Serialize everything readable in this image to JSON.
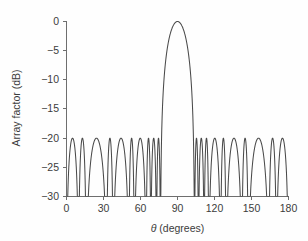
{
  "chart_data": {
    "type": "line",
    "title": "",
    "xlabel": "θ (degrees)",
    "ylabel": "Array factor (dB)",
    "xlim": [
      0,
      180
    ],
    "ylim": [
      -30,
      0
    ],
    "xticks": [
      0,
      30,
      60,
      90,
      120,
      150,
      180
    ],
    "xtick_labels": [
      "0",
      "30",
      "60",
      "90",
      "120",
      "150",
      "180"
    ],
    "yticks": [
      0,
      -5,
      -10,
      -15,
      -20,
      -25,
      -30
    ],
    "ytick_labels": [
      "0",
      "−5",
      "−10",
      "−15",
      "−20",
      "−25",
      "−30"
    ],
    "grid": false,
    "legend": null,
    "series": [
      {
        "name": "Array factor",
        "color": "#4a4a4a",
        "peak_value_db": 0,
        "peak_angle_deg": 90,
        "sidelobe_level_db": -20,
        "nulls_deg": [
          9.8,
          16.0,
          32.6,
          37.8,
          50.6,
          55.0,
          64.6,
          68.4,
          73.0,
          76.2,
          103.8,
          107.0,
          111.6,
          115.4,
          125.0,
          129.4,
          142.2,
          147.4,
          164.0,
          170.2
        ],
        "sidelobe_peaks": [
          {
            "angle_deg": 13.0,
            "value_db": -20.4
          },
          {
            "angle_deg": 24.4,
            "value_db": -20.2
          },
          {
            "angle_deg": 35.2,
            "value_db": -20.3
          },
          {
            "angle_deg": 44.6,
            "value_db": -20.2
          },
          {
            "angle_deg": 53.0,
            "value_db": -20.3
          },
          {
            "angle_deg": 58.5,
            "value_db": -20.2
          },
          {
            "angle_deg": 66.5,
            "value_db": -20.3
          },
          {
            "angle_deg": 71.0,
            "value_db": -20.2
          },
          {
            "angle_deg": 74.6,
            "value_db": -20.4
          },
          {
            "angle_deg": 105.4,
            "value_db": -20.4
          },
          {
            "angle_deg": 109.0,
            "value_db": -20.2
          },
          {
            "angle_deg": 113.5,
            "value_db": -20.3
          },
          {
            "angle_deg": 121.5,
            "value_db": -20.2
          },
          {
            "angle_deg": 127.0,
            "value_db": -20.3
          },
          {
            "angle_deg": 135.4,
            "value_db": -20.2
          },
          {
            "angle_deg": 144.8,
            "value_db": -20.3
          },
          {
            "angle_deg": 155.6,
            "value_db": -20.2
          },
          {
            "angle_deg": 167.0,
            "value_db": -20.4
          }
        ],
        "endpoints": [
          {
            "angle_deg": 0,
            "value_db": -21.2
          },
          {
            "angle_deg": 180,
            "value_db": -21.2
          }
        ],
        "mainlobe_edges_deg": [
          76.2,
          103.8
        ],
        "x": [
          0,
          2,
          4,
          6,
          8,
          9.8,
          11,
          13,
          15,
          16,
          18,
          20,
          22,
          24.4,
          26,
          28,
          30,
          32.6,
          34,
          35.2,
          36,
          37.8,
          40,
          42,
          44.6,
          47,
          49,
          50.6,
          52,
          53,
          54,
          55,
          57,
          58.5,
          60,
          62,
          64.6,
          66.5,
          68.4,
          70,
          71,
          72,
          73,
          74.6,
          76.2,
          78,
          80,
          82,
          84,
          86,
          88,
          90,
          92,
          94,
          96,
          98,
          100,
          102,
          103.8,
          105.4,
          107,
          109,
          111.6,
          113.5,
          115.4,
          118,
          121.5,
          125,
          127,
          129.4,
          132,
          135.4,
          139,
          142.2,
          144.8,
          147.4,
          151,
          155.6,
          160,
          164,
          167,
          170.2,
          174,
          177,
          180
        ],
        "y": [
          -21.2,
          -22.0,
          -23.6,
          -26.2,
          -29.5,
          -41,
          -29.0,
          -20.4,
          -25.0,
          -33,
          -25.5,
          -22.0,
          -20.6,
          -20.2,
          -20.7,
          -22.4,
          -25.6,
          -40,
          -24.0,
          -20.3,
          -21.0,
          -39,
          -24.8,
          -21.4,
          -20.2,
          -21.6,
          -25.8,
          -41,
          -23.0,
          -20.3,
          -23.2,
          -38,
          -22.0,
          -20.2,
          -21.8,
          -26.5,
          -40,
          -20.3,
          -39,
          -22.0,
          -20.2,
          -23.0,
          -37,
          -20.4,
          -38,
          -22.0,
          -14.5,
          -9.2,
          -5.0,
          -2.2,
          -0.55,
          0.0,
          -0.55,
          -2.2,
          -5.0,
          -9.2,
          -14.5,
          -22.0,
          -38,
          -20.4,
          -37,
          -20.2,
          -39,
          -20.3,
          -40,
          -24.0,
          -20.2,
          -20.6,
          -20.3,
          -38,
          -23.5,
          -20.2,
          -23.8,
          -41,
          -20.3,
          -39,
          -24.5,
          -20.2,
          -22.2,
          -40,
          -20.4,
          -31.0,
          -24.6,
          -22.4,
          -21.2
        ]
      }
    ]
  },
  "axes": {
    "y_axis_title": "Array factor (dB)",
    "x_axis_title_symbol": "θ",
    "x_axis_title_rest": " (degrees)"
  }
}
